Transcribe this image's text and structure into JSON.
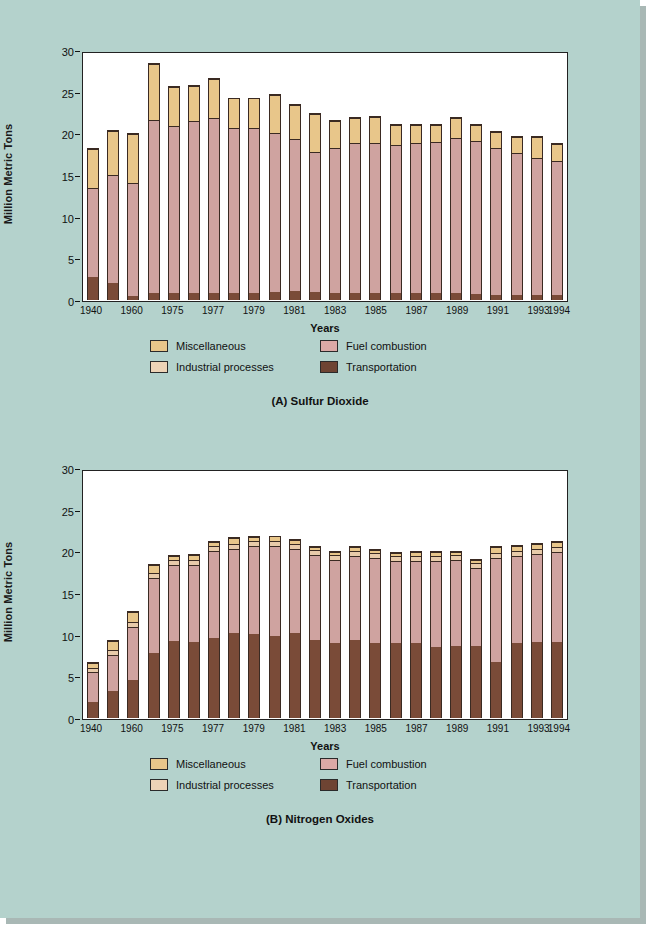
{
  "page": {
    "background_color": "#b4d2cc"
  },
  "legend": {
    "items": [
      {
        "label": "Miscellaneous",
        "key": "misc",
        "color": "#e8c68a"
      },
      {
        "label": "Fuel combustion",
        "key": "fuel",
        "color": "#dba9a6"
      },
      {
        "label": "Industrial processes",
        "key": "industrial",
        "color": "#edd3b6"
      },
      {
        "label": "Transportation",
        "key": "transportation",
        "color": "#6e4433"
      }
    ]
  },
  "figures": [
    {
      "id": "a",
      "caption": "(A) Sulfur Dioxide"
    },
    {
      "id": "b",
      "caption": "(B) Nitrogen Oxides"
    }
  ],
  "chart_data": [
    {
      "type": "bar",
      "stacked": true,
      "title": "(A) Sulfur Dioxide",
      "xlabel": "Years",
      "ylabel": "Million Metric Tons",
      "ylim": [
        0,
        30
      ],
      "yticks": [
        0,
        5,
        10,
        15,
        20,
        25,
        30
      ],
      "grid": false,
      "legend_position": "below",
      "categories": [
        "1940",
        "1950",
        "1960",
        "1970",
        "1975",
        "1976",
        "1977",
        "1978",
        "1979",
        "1980",
        "1981",
        "1982",
        "1983",
        "1984",
        "1985",
        "1986",
        "1987",
        "1988",
        "1989",
        "1990",
        "1991",
        "1992",
        "1993",
        "1994"
      ],
      "tick_labels": [
        "1940",
        "",
        "1960",
        "",
        "1975",
        "",
        "1977",
        "",
        "1979",
        "",
        "1981",
        "",
        "1983",
        "",
        "1985",
        "",
        "1987",
        "",
        "1989",
        "",
        "1991",
        "",
        "1993",
        "1994"
      ],
      "series": [
        {
          "name": "Transportation",
          "color": "#7a4b38",
          "values": [
            2.8,
            2.1,
            0.5,
            0.9,
            0.8,
            0.8,
            0.9,
            0.9,
            0.9,
            1.0,
            1.1,
            1.0,
            0.9,
            0.9,
            0.9,
            0.9,
            0.9,
            0.9,
            0.9,
            0.7,
            0.6,
            0.6,
            0.6,
            0.6
          ]
        },
        {
          "name": "Fuel combustion",
          "color": "#cfa3a0",
          "values": [
            10.7,
            13.0,
            13.6,
            20.8,
            20.2,
            20.8,
            21.1,
            19.8,
            19.8,
            19.1,
            18.3,
            16.8,
            17.5,
            18.1,
            18.1,
            17.8,
            18.0,
            18.2,
            18.6,
            18.5,
            17.7,
            17.2,
            16.6,
            16.2
          ]
        },
        {
          "name": "Industrial processes",
          "color": "#e8cbaa",
          "values": [
            0.0,
            0.0,
            0.0,
            0.0,
            0.0,
            0.0,
            0.0,
            0.0,
            0.0,
            0.0,
            0.0,
            0.0,
            0.0,
            0.0,
            0.0,
            0.0,
            0.0,
            0.0,
            0.0,
            0.0,
            0.0,
            0.0,
            0.0,
            0.0
          ]
        },
        {
          "name": "Miscellaneous",
          "color": "#e8c68a",
          "values": [
            4.7,
            5.3,
            6.0,
            6.8,
            4.7,
            4.2,
            4.6,
            3.6,
            3.6,
            4.6,
            4.1,
            4.6,
            3.2,
            3.0,
            3.1,
            2.4,
            2.2,
            2.0,
            2.5,
            1.9,
            2.0,
            1.9,
            2.5,
            2.0
          ]
        }
      ]
    },
    {
      "type": "bar",
      "stacked": true,
      "title": "(B) Nitrogen Oxides",
      "xlabel": "Years",
      "ylabel": "Million Metric Tons",
      "ylim": [
        0,
        30
      ],
      "yticks": [
        0,
        5,
        10,
        15,
        20,
        25,
        30
      ],
      "grid": false,
      "legend_position": "below",
      "categories": [
        "1940",
        "1950",
        "1960",
        "1970",
        "1975",
        "1976",
        "1977",
        "1978",
        "1979",
        "1980",
        "1981",
        "1982",
        "1983",
        "1984",
        "1985",
        "1986",
        "1987",
        "1988",
        "1989",
        "1990",
        "1991",
        "1992",
        "1993",
        "1994"
      ],
      "tick_labels": [
        "1940",
        "",
        "1960",
        "",
        "1975",
        "",
        "1977",
        "",
        "1979",
        "",
        "1981",
        "",
        "1983",
        "",
        "1985",
        "",
        "1987",
        "",
        "1989",
        "",
        "1991",
        "",
        "1993",
        "1994"
      ],
      "series": [
        {
          "name": "Transportation",
          "color": "#7a4b38",
          "values": [
            1.9,
            3.3,
            4.6,
            7.8,
            9.3,
            9.2,
            9.7,
            10.3,
            10.1,
            9.9,
            10.2,
            9.4,
            9.0,
            9.4,
            9.0,
            9.1,
            9.1,
            8.6,
            8.7,
            8.7,
            6.8,
            9.1,
            9.2,
            9.2
          ]
        },
        {
          "name": "Fuel combustion",
          "color": "#cfa3a0",
          "values": [
            3.7,
            4.4,
            6.4,
            9.1,
            9.2,
            9.3,
            10.4,
            10.1,
            10.6,
            10.8,
            10.2,
            10.3,
            10.1,
            10.1,
            10.3,
            9.8,
            9.9,
            10.4,
            10.4,
            9.4,
            12.5,
            10.4,
            10.6,
            10.8
          ]
        },
        {
          "name": "Industrial processes",
          "color": "#e8cbaa",
          "values": [
            0.5,
            0.6,
            0.6,
            0.6,
            0.6,
            0.6,
            0.6,
            0.6,
            0.6,
            0.6,
            0.6,
            0.6,
            0.6,
            0.6,
            0.6,
            0.6,
            0.6,
            0.6,
            0.6,
            0.6,
            0.6,
            0.6,
            0.6,
            0.6
          ]
        },
        {
          "name": "Miscellaneous",
          "color": "#e8c68a",
          "values": [
            0.6,
            1.1,
            1.2,
            1.0,
            0.5,
            0.6,
            0.5,
            0.7,
            0.6,
            0.6,
            0.5,
            0.4,
            0.4,
            0.5,
            0.4,
            0.4,
            0.4,
            0.4,
            0.4,
            0.4,
            0.7,
            0.7,
            0.6,
            0.7
          ]
        }
      ]
    }
  ]
}
